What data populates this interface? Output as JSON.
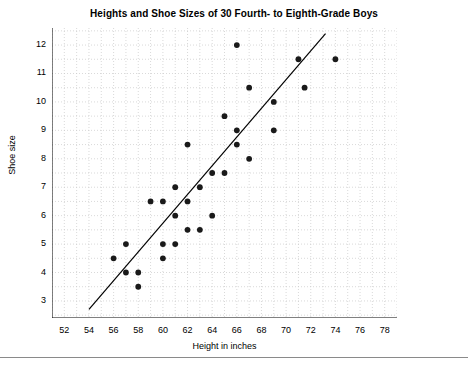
{
  "chart_data": {
    "type": "scatter",
    "title": "Heights and Shoe Sizes of 30 Fourth- to Eighth-Grade Boys",
    "xlabel": "Height in inches",
    "ylabel": "Shoe size",
    "xlim": [
      51,
      79
    ],
    "ylim": [
      2.4,
      12.6
    ],
    "xticks": [
      52,
      54,
      56,
      58,
      60,
      62,
      64,
      66,
      68,
      70,
      72,
      74,
      76,
      78
    ],
    "yticks": [
      3,
      4,
      5,
      6,
      7,
      8,
      9,
      10,
      11,
      12
    ],
    "grid": true,
    "grid_style": "dotted",
    "grid_color": "#c8c8c8",
    "legend": null,
    "point_color": "#1a1a1a",
    "point_size": 5,
    "line_color": "#000000",
    "trendline": {
      "type": "line",
      "x_start": 54.0,
      "y_start": 2.7,
      "x_end": 73.2,
      "y_end": 12.4
    },
    "points": [
      {
        "x": 56.0,
        "y": 4.5
      },
      {
        "x": 57.0,
        "y": 5.0
      },
      {
        "x": 57.0,
        "y": 4.0
      },
      {
        "x": 58.0,
        "y": 4.0
      },
      {
        "x": 58.0,
        "y": 3.5
      },
      {
        "x": 59.0,
        "y": 6.5
      },
      {
        "x": 60.0,
        "y": 6.5
      },
      {
        "x": 60.0,
        "y": 5.0
      },
      {
        "x": 60.0,
        "y": 4.5
      },
      {
        "x": 61.0,
        "y": 7.0
      },
      {
        "x": 61.0,
        "y": 6.0
      },
      {
        "x": 61.0,
        "y": 5.0
      },
      {
        "x": 62.0,
        "y": 8.5
      },
      {
        "x": 62.0,
        "y": 6.5
      },
      {
        "x": 62.0,
        "y": 5.5
      },
      {
        "x": 63.0,
        "y": 7.0
      },
      {
        "x": 63.0,
        "y": 5.5
      },
      {
        "x": 64.0,
        "y": 7.5
      },
      {
        "x": 64.0,
        "y": 6.0
      },
      {
        "x": 65.0,
        "y": 9.5
      },
      {
        "x": 65.0,
        "y": 7.5
      },
      {
        "x": 66.0,
        "y": 12.0
      },
      {
        "x": 66.0,
        "y": 9.0
      },
      {
        "x": 66.0,
        "y": 8.5
      },
      {
        "x": 67.0,
        "y": 10.5
      },
      {
        "x": 67.0,
        "y": 8.0
      },
      {
        "x": 69.0,
        "y": 10.0
      },
      {
        "x": 69.0,
        "y": 9.0
      },
      {
        "x": 71.0,
        "y": 11.5
      },
      {
        "x": 71.5,
        "y": 10.5
      },
      {
        "x": 74.0,
        "y": 11.5
      }
    ]
  }
}
